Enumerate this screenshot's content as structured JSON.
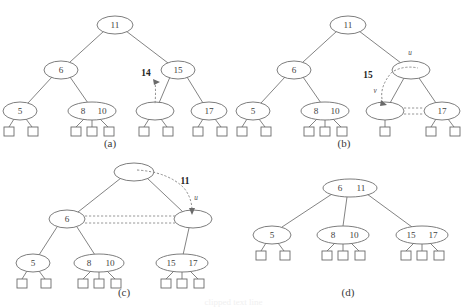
{
  "figure": {
    "background_color": "#ffffff",
    "node_stroke_color": "#6e6e6e",
    "edge_color": "#757575",
    "dashed_color": "#8c8c8c",
    "text_color": "#3f3f3f"
  },
  "panels": [
    {
      "id": "a",
      "label": "(a)",
      "label_x": 110,
      "label_y": 144,
      "callouts": [
        {
          "name": "insert-key-callout",
          "text": "14",
          "x": 146,
          "y": 74
        }
      ],
      "var_labels": [],
      "nodes": [
        {
          "name": "root-node",
          "keys": [
            "11"
          ],
          "cx": 115,
          "cy": 25,
          "rx": 18,
          "ry": 9
        },
        {
          "name": "internal-node-6",
          "keys": [
            "6"
          ],
          "cx": 61,
          "cy": 70,
          "rx": 17,
          "ry": 9
        },
        {
          "name": "internal-node-15",
          "keys": [
            "15"
          ],
          "cx": 178,
          "cy": 70,
          "rx": 17,
          "ry": 9
        },
        {
          "name": "leaf-node-5",
          "keys": [
            "5"
          ],
          "cx": 20,
          "cy": 111,
          "rx": 17,
          "ry": 9
        },
        {
          "name": "leaf-node-8-10",
          "keys": [
            "8",
            "10"
          ],
          "cx": 92,
          "cy": 111,
          "rx": 24,
          "ry": 9
        },
        {
          "name": "leaf-node-empty",
          "keys": [],
          "cx": 155,
          "cy": 111,
          "rx": 19,
          "ry": 9
        },
        {
          "name": "leaf-node-17",
          "keys": [
            "17"
          ],
          "cx": 209,
          "cy": 111,
          "rx": 18,
          "ry": 9
        }
      ]
    },
    {
      "id": "b",
      "label": "(b)",
      "label_x": 344,
      "label_y": 144,
      "callouts": [
        {
          "name": "overflow-key-callout",
          "text": "15",
          "x": 368,
          "y": 76
        }
      ],
      "var_labels": [
        {
          "name": "node-u-label",
          "text": "u",
          "x": 410,
          "y": 53
        },
        {
          "name": "node-v-label",
          "text": "v",
          "x": 375,
          "y": 91
        }
      ],
      "nodes": [
        {
          "name": "root-node",
          "keys": [
            "11"
          ],
          "cx": 348,
          "cy": 25,
          "rx": 18,
          "ry": 9
        },
        {
          "name": "internal-node-6",
          "keys": [
            "6"
          ],
          "cx": 294,
          "cy": 70,
          "rx": 17,
          "ry": 9
        },
        {
          "name": "internal-node-u-empty",
          "keys": [],
          "cx": 411,
          "cy": 70,
          "rx": 19,
          "ry": 9
        },
        {
          "name": "leaf-node-5",
          "keys": [
            "5"
          ],
          "cx": 253,
          "cy": 111,
          "rx": 17,
          "ry": 9
        },
        {
          "name": "leaf-node-8-10",
          "keys": [
            "8",
            "10"
          ],
          "cx": 325,
          "cy": 111,
          "rx": 24,
          "ry": 9
        },
        {
          "name": "leaf-node-v-empty",
          "keys": [],
          "cx": 385,
          "cy": 111,
          "rx": 19,
          "ry": 9
        },
        {
          "name": "leaf-node-17",
          "keys": [
            "17"
          ],
          "cx": 442,
          "cy": 111,
          "rx": 18,
          "ry": 9
        }
      ]
    },
    {
      "id": "c",
      "label": "(c)",
      "label_x": 124,
      "label_y": 293,
      "callouts": [
        {
          "name": "promoted-key-callout",
          "text": "11",
          "x": 185,
          "y": 182
        }
      ],
      "var_labels": [
        {
          "name": "node-u-label",
          "text": "u",
          "x": 196,
          "y": 198
        }
      ],
      "nodes": [
        {
          "name": "root-node-empty",
          "keys": [],
          "cx": 134,
          "cy": 172,
          "rx": 20,
          "ry": 9
        },
        {
          "name": "internal-node-6",
          "keys": [
            "6"
          ],
          "cx": 67,
          "cy": 219,
          "rx": 18,
          "ry": 9
        },
        {
          "name": "internal-node-u-empty",
          "keys": [],
          "cx": 193,
          "cy": 219,
          "rx": 19,
          "ry": 9
        },
        {
          "name": "leaf-node-5",
          "keys": [
            "5"
          ],
          "cx": 33,
          "cy": 263,
          "rx": 17,
          "ry": 9
        },
        {
          "name": "leaf-node-8-10",
          "keys": [
            "8",
            "10"
          ],
          "cx": 99,
          "cy": 263,
          "rx": 25,
          "ry": 9
        },
        {
          "name": "leaf-node-15-17",
          "keys": [
            "15",
            "17"
          ],
          "cx": 182,
          "cy": 263,
          "rx": 26,
          "ry": 9
        }
      ]
    },
    {
      "id": "d",
      "label": "(d)",
      "label_x": 348,
      "label_y": 293,
      "callouts": [],
      "var_labels": [],
      "nodes": [
        {
          "name": "root-node-6-11",
          "keys": [
            "6",
            "11"
          ],
          "cx": 350,
          "cy": 188,
          "rx": 27,
          "ry": 9
        },
        {
          "name": "leaf-node-5",
          "keys": [
            "5"
          ],
          "cx": 272,
          "cy": 235,
          "rx": 19,
          "ry": 9
        },
        {
          "name": "leaf-node-8-10",
          "keys": [
            "8",
            "10"
          ],
          "cx": 343,
          "cy": 235,
          "rx": 26,
          "ry": 9
        },
        {
          "name": "leaf-node-15-17",
          "keys": [
            "15",
            "17"
          ],
          "cx": 422,
          "cy": 235,
          "rx": 26,
          "ry": 9
        }
      ]
    }
  ],
  "footer": {
    "ghost_text": "clipped text line"
  }
}
